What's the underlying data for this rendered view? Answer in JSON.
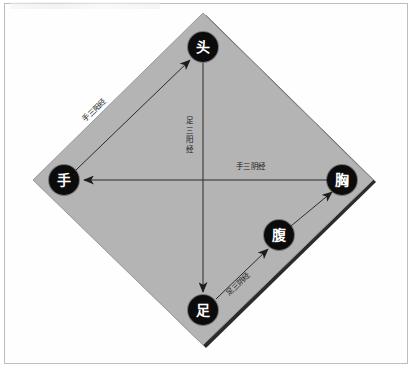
{
  "figure": {
    "shape": "diamond",
    "fill_color": "#b4b4b4",
    "edge_shadow_color": "#2b2b2b",
    "background_color": "#ffffff",
    "frame_color": "#bdbdbd",
    "node_fill": "#0b0b0b",
    "node_text_color": "#ffffff",
    "arrow_color": "#2a2a2a"
  },
  "nodes": [
    {
      "id": "head",
      "label": "头",
      "x": 203,
      "y": 47,
      "r": 15
    },
    {
      "id": "hand",
      "label": "手",
      "x": 64,
      "y": 180,
      "r": 15
    },
    {
      "id": "chest",
      "label": "胸",
      "x": 342,
      "y": 180,
      "r": 15
    },
    {
      "id": "abdomen",
      "label": "腹",
      "x": 279,
      "y": 235,
      "r": 15
    },
    {
      "id": "foot",
      "label": "足",
      "x": 203,
      "y": 310,
      "r": 15
    }
  ],
  "arrows": [
    {
      "id": "hand-to-head",
      "from": "hand",
      "to": "head",
      "label": "手三阳经"
    },
    {
      "id": "head-to-foot",
      "from": "head",
      "to": "foot",
      "label": "足三阳经"
    },
    {
      "id": "chest-to-hand",
      "from": "chest",
      "to": "hand",
      "label": "手三阴经"
    },
    {
      "id": "foot-to-abdomen",
      "from": "foot",
      "to": "abdomen",
      "label": "足三阴经"
    },
    {
      "id": "abdomen-to-chest",
      "from": "abdomen",
      "to": "chest",
      "label": ""
    }
  ],
  "labels": {
    "hand_three_yang": "手三阳经",
    "foot_three_yang": "足三阳经",
    "hand_three_yin": "手三阴经",
    "foot_three_yin": "足三阴经"
  },
  "vertical_label_chars": {
    "foot_three_yang": [
      "足",
      "三",
      "阳",
      "经"
    ]
  }
}
